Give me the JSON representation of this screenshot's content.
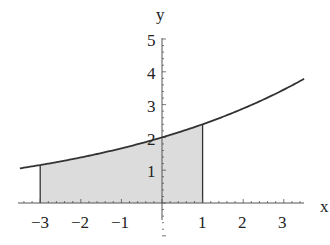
{
  "chart_data": {
    "type": "area",
    "title": "",
    "xlabel": "x",
    "ylabel": "y",
    "function": "y = 2*1.2^x",
    "x": [
      -3.5,
      -3,
      -2,
      -1,
      0,
      1,
      2,
      3,
      3.5
    ],
    "values": [
      1.06,
      1.16,
      1.39,
      1.67,
      2.0,
      2.4,
      2.88,
      3.46,
      3.79
    ],
    "shaded_interval": [
      -3,
      1
    ],
    "xlim": [
      -3.5,
      3.5
    ],
    "ylim": [
      0,
      5
    ],
    "xticks": [
      "-3",
      "-2",
      "-1",
      "1",
      "2",
      "3"
    ],
    "yticks": [
      "1",
      "2",
      "3",
      "4",
      "5"
    ],
    "grid": false,
    "colors": {
      "curve": "#333333",
      "fill": "#dcdcdc",
      "axis": "#555555"
    }
  },
  "labels": {
    "x_axis": "x",
    "y_axis": "y",
    "xticks": [
      "−3",
      "−2",
      "−1",
      "1",
      "2",
      "3"
    ],
    "yticks": [
      "1",
      "2",
      "3",
      "4",
      "5"
    ]
  }
}
